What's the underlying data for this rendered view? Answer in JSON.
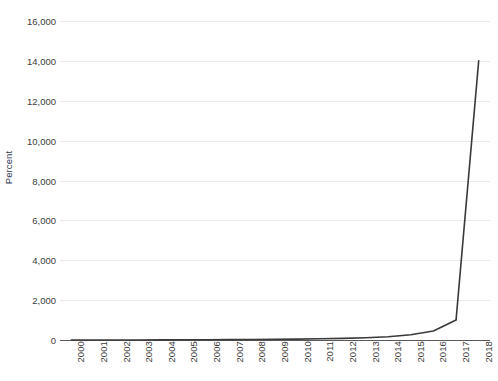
{
  "chart_data": {
    "type": "line",
    "title": "",
    "subtitle": "",
    "xlabel": "",
    "ylabel": "Percent",
    "ylim": [
      0,
      16000
    ],
    "ytick_step": 2000,
    "yticks": [
      0,
      2000,
      4000,
      6000,
      8000,
      10000,
      12000,
      14000,
      16000
    ],
    "ytick_labels": [
      "0",
      "2,000",
      "4,000",
      "6,000",
      "8,000",
      "10,000",
      "12,000",
      "14,000",
      "16,000"
    ],
    "grid": true,
    "legend": "none",
    "categories": [
      "2000",
      "2001",
      "2002",
      "2003",
      "2004",
      "2005",
      "2006",
      "2007",
      "2008",
      "2009",
      "2010",
      "2011",
      "2012",
      "2013",
      "2014",
      "2015",
      "2016",
      "2017",
      "2018"
    ],
    "x": [
      2000,
      2001,
      2002,
      2003,
      2004,
      2005,
      2006,
      2007,
      2008,
      2009,
      2010,
      2011,
      2012,
      2013,
      2014,
      2015,
      2016,
      2017,
      2018
    ],
    "values": [
      0,
      0,
      0,
      0,
      5,
      10,
      15,
      20,
      25,
      35,
      45,
      60,
      80,
      110,
      160,
      260,
      450,
      1000,
      14000
    ],
    "series": [
      {
        "name": "Percent",
        "color": "#3a3a3a",
        "values": [
          0,
          0,
          0,
          0,
          5,
          10,
          15,
          20,
          25,
          35,
          45,
          60,
          80,
          110,
          160,
          260,
          450,
          1000,
          14000
        ]
      }
    ],
    "colors": {
      "line": "#3a3a3a",
      "gridline": "#e9e9e9",
      "axis": "#5a5a5a",
      "ylabel_text": "#2e3a57",
      "tick_text": "#3b3b3b",
      "background": "#ffffff"
    }
  }
}
